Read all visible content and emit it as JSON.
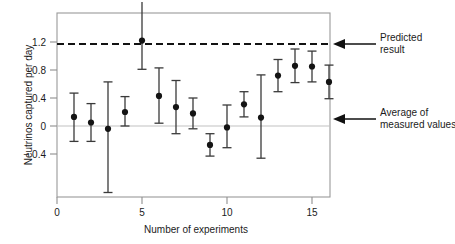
{
  "chart_data": {
    "type": "scatter",
    "title": "",
    "xlabel": "Number of experiments",
    "ylabel": "Neutrinos captured per day",
    "xlim": [
      0,
      16.8
    ],
    "ylim": [
      -0.75,
      1.47
    ],
    "grid": false,
    "legend_position": "none",
    "x_ticks": [
      {
        "value": 0,
        "label": "0"
      },
      {
        "value": 5,
        "label": "5"
      },
      {
        "value": 10,
        "label": "10"
      },
      {
        "value": 15,
        "label": "15"
      }
    ],
    "y_ticks": [
      {
        "value": 1.2,
        "label": "1.2"
      },
      {
        "value": 0.8,
        "label": "0.8"
      },
      {
        "value": 0.4,
        "label": "0.4"
      },
      {
        "value": 0,
        "label": "0"
      },
      {
        "value": -0.4,
        "label": "− 0.4"
      }
    ],
    "reference_lines": [
      {
        "name": "predicted-result",
        "value": 1.15,
        "style": "dashed",
        "color": "#121212"
      },
      {
        "name": "zero-line",
        "value": 0,
        "style": "solid",
        "color": "#c2c2c2"
      }
    ],
    "series": [
      {
        "name": "measured values",
        "marker": "filled-circle",
        "color": "#141414",
        "x": [
          1,
          2,
          3,
          4,
          5,
          6,
          7,
          8,
          9,
          10,
          11,
          12,
          13,
          14,
          15,
          16
        ],
        "values": [
          0.13,
          0.05,
          -0.04,
          0.2,
          1.22,
          0.43,
          0.27,
          0.18,
          -0.27,
          -0.02,
          0.31,
          0.12,
          0.72,
          0.86,
          0.85,
          0.63
        ],
        "err_low": [
          -0.22,
          -0.22,
          -0.95,
          0.0,
          0.81,
          0.04,
          -0.11,
          -0.04,
          -0.43,
          -0.31,
          0.13,
          -0.46,
          0.49,
          0.62,
          0.63,
          0.39
        ],
        "err_high": [
          0.47,
          0.32,
          0.63,
          0.42,
          1.47,
          0.83,
          0.65,
          0.4,
          -0.11,
          0.3,
          0.49,
          0.73,
          0.95,
          1.1,
          1.07,
          0.87
        ],
        "err_high_clipped": [
          false,
          false,
          false,
          false,
          true,
          false,
          false,
          false,
          false,
          false,
          false,
          false,
          false,
          false,
          false,
          false
        ]
      }
    ],
    "annotations": [
      {
        "name": "predicted-result",
        "text_line1": "Predicted",
        "text_line2": "result",
        "points_to_value": 1.15
      },
      {
        "name": "average-of-measured-values",
        "text_line1": "Average of",
        "text_line2": "measured values",
        "points_to_value": 0.31
      }
    ]
  }
}
